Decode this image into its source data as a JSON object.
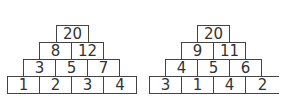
{
  "pyramids": [
    {
      "rows": [
        [
          "20"
        ],
        [
          "8",
          "12"
        ],
        [
          "3",
          "5",
          "7"
        ],
        [
          "1",
          "2",
          "3",
          "4"
        ]
      ]
    },
    {
      "rows": [
        [
          "20"
        ],
        [
          "9",
          "11"
        ],
        [
          "4",
          "5",
          "6"
        ],
        [
          "3",
          "1",
          "4",
          "2"
        ]
      ]
    }
  ]
}
